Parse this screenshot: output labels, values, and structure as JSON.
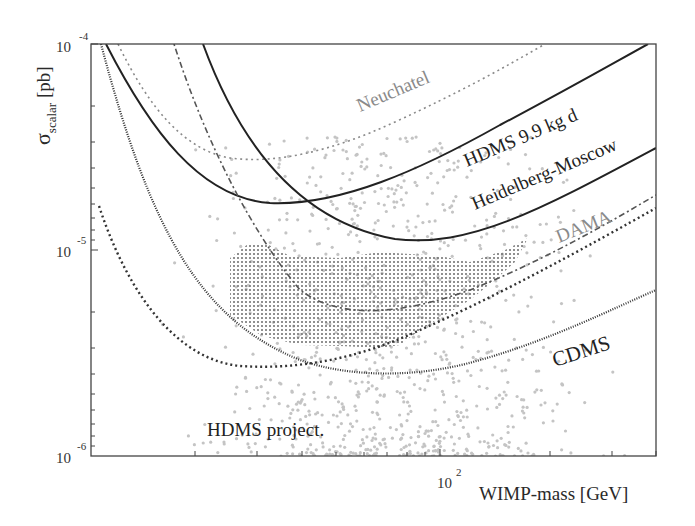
{
  "chart_data": {
    "type": "line",
    "title": "",
    "xlabel": "WIMP-mass [GeV]",
    "ylabel": "σ_scalar [pb]",
    "xscale": "log",
    "yscale": "log",
    "xlim": [
      10,
      414
    ],
    "ylim": [
      1e-06,
      0.0001
    ],
    "x_tick_labels": [
      {
        "value": 100,
        "label": "10",
        "exp": "2"
      }
    ],
    "y_tick_labels": [
      {
        "value": 0.0001,
        "label": "10",
        "exp": "-4"
      },
      {
        "value": 1e-05,
        "label": "10",
        "exp": "-5"
      },
      {
        "value": 1e-06,
        "label": "10",
        "exp": "-6"
      }
    ],
    "grid": false,
    "legend": "inline curve labels",
    "series": [
      {
        "name": "Neuchatel",
        "style": "dotted",
        "color": "#8a8a8a",
        "x": [
          10.8,
          15,
          20,
          25,
          30,
          40,
          60,
          100,
          150,
          250
        ],
        "y": [
          0.0001,
          5e-05,
          3.4e-05,
          2.9e-05,
          2.9e-05,
          3.3e-05,
          4.4e-05,
          6.5e-05,
          8.4e-05,
          0.0001
        ]
      },
      {
        "name": "HDMS 9.9 kg d",
        "style": "solid",
        "color": "#222222",
        "x": [
          10.5,
          15,
          20,
          30,
          40,
          60,
          100,
          200,
          380
        ],
        "y": [
          0.0001,
          4e-05,
          2.5e-05,
          1.75e-05,
          1.75e-05,
          2.3e-05,
          3.4e-05,
          6.2e-05,
          0.0001
        ]
      },
      {
        "name": "Heidelberg-Moscow",
        "style": "solid",
        "color": "#222222",
        "x": [
          30.7,
          40,
          50,
          70,
          90,
          120,
          200,
          414
        ],
        "y": [
          0.0001,
          3.9e-05,
          2e-05,
          1.25e-05,
          1.1e-05,
          1.15e-05,
          1.6e-05,
          3.2e-05
        ]
      },
      {
        "name": "DAMA",
        "style": "dash-dot",
        "color": "#555555",
        "x": [
          19.5,
          25,
          30,
          40,
          60,
          90,
          120,
          200,
          414
        ],
        "y": [
          0.0001,
          4.5e-05,
          1.6e-05,
          6.5e-06,
          4e-06,
          3.7e-06,
          4.3e-06,
          7.5e-06,
          1.7e-05
        ]
      },
      {
        "name": "CDMS",
        "style": "dense-dotted",
        "color": "#333333",
        "x": [
          10.3,
          15,
          20,
          30,
          40,
          60,
          80,
          120,
          200,
          414
        ],
        "y": [
          0.0001,
          2.5e-05,
          1.1e-05,
          5e-06,
          3.5e-06,
          2.8e-06,
          2.7e-06,
          3.1e-06,
          4.3e-06,
          6.7e-06
        ]
      },
      {
        "name": "HDMS project",
        "style": "dotted-bold",
        "color": "#333333",
        "x": [
          10.4,
          15,
          20,
          30,
          40,
          60,
          80,
          120,
          200,
          414
        ],
        "y": [
          1.3e-05,
          4.5e-06,
          2.6e-06,
          1.8e-06,
          1.75e-06,
          2.1e-06,
          2.7e-06,
          4e-06,
          6.5e-06,
          1.4e-05
        ]
      }
    ],
    "regions": [
      {
        "name": "DAMA allowed region",
        "style": "cross-hatched",
        "color": "#555555",
        "x_range": [
          28,
          170
        ],
        "y_range": [
          2.6e-06,
          1e-05
        ]
      }
    ],
    "scatter": {
      "name": "theory scan points",
      "color": "#bbbbbb",
      "description": "gray points concentrated around 50-150 GeV, 1e-6 to 2e-5 pb"
    }
  },
  "labels": {
    "y_axis_sigma": "σ",
    "y_axis_sub": "scalar",
    "y_axis_unit": " [pb]",
    "x_axis": "WIMP-mass [GeV]",
    "y_ticks": [
      {
        "base": "10",
        "exp": "-4"
      },
      {
        "base": "10",
        "exp": "-5"
      },
      {
        "base": "10",
        "exp": "-6"
      }
    ],
    "x_ticks": [
      {
        "base": "10",
        "exp": "2"
      }
    ],
    "curves": {
      "neuchatel": "Neuchatel",
      "hdms99": "HDMS 9.9 kg d",
      "hm": "Heidelberg-Moscow",
      "dama": "DAMA",
      "cdms": "CDMS",
      "hdms_project": "HDMS project."
    }
  }
}
